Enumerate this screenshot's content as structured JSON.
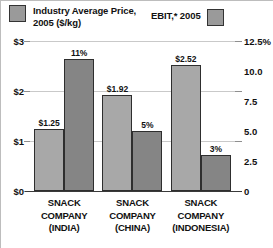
{
  "legend": {
    "price": {
      "label": "Industry Average Price,\n2005 ($/kg)",
      "swatch": "legend-swatch-price",
      "color": "#9a9a9a"
    },
    "ebit": {
      "label": "EBIT,* 2005",
      "swatch": "legend-swatch-ebit",
      "color": "#9a9a9a"
    }
  },
  "axes": {
    "left": {
      "ticks": [
        "$3",
        "$2",
        "$1",
        "$0"
      ]
    },
    "right": {
      "ticks": [
        "12.5%",
        "10.0",
        "7.5",
        "5.0",
        "2.5",
        "0"
      ]
    }
  },
  "categories_display": [
    "SNACK\nCOMPANY\n(INDIA)",
    "SNACK\nCOMPANY\n(CHINA)",
    "SNACK\nCOMPANY\n(INDONESIA)"
  ],
  "bar_labels": {
    "price": [
      "$1.25",
      "$1.92",
      "$2.52"
    ],
    "ebit": [
      "11%",
      "5%",
      "3%"
    ]
  },
  "colors": {
    "price_bar": "#a8a8a8",
    "ebit_bar": "#858585",
    "bar_border": "#2e2e2e",
    "gridline": "#c9c9c9",
    "baseline": "#3a3a3a",
    "text": "#111111"
  },
  "chart_data": {
    "type": "bar",
    "title": "",
    "categories": [
      "SNACK COMPANY (INDIA)",
      "SNACK COMPANY (CHINA)",
      "SNACK COMPANY (INDONESIA)"
    ],
    "series": [
      {
        "name": "Industry Average Price, 2005 ($/kg)",
        "axis": "left",
        "values": [
          1.25,
          1.92,
          2.52
        ],
        "labels": [
          "$1.25",
          "$1.92",
          "$2.52"
        ],
        "color": "#a8a8a8"
      },
      {
        "name": "EBIT,* 2005",
        "axis": "right",
        "values": [
          11,
          5,
          3
        ],
        "labels": [
          "11%",
          "5%",
          "3%"
        ],
        "color": "#858585"
      }
    ],
    "xlabel": "",
    "ylabel": "Industry Average Price, 2005 ($/kg)",
    "y2label": "EBIT,* 2005",
    "ylim": [
      0,
      3
    ],
    "y2lim": [
      0,
      12.5
    ],
    "yticks": [
      0,
      1,
      2,
      3
    ],
    "ytick_labels": [
      "$0",
      "$1",
      "$2",
      "$3"
    ],
    "y2ticks": [
      0,
      2.5,
      5.0,
      7.5,
      10.0,
      12.5
    ],
    "y2tick_labels": [
      "0",
      "2.5",
      "5.0",
      "7.5",
      "10.0",
      "12.5%"
    ],
    "grid": true,
    "legend_position": "top"
  }
}
